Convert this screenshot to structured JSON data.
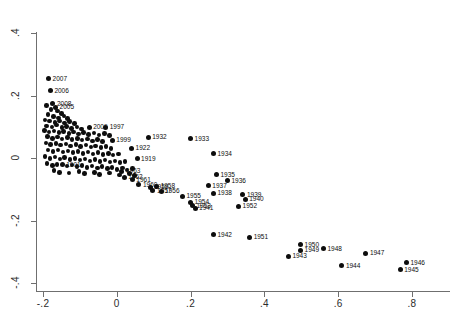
{
  "chart_data": {
    "type": "scatter",
    "title": "",
    "xlabel": "",
    "ylabel": "",
    "xlim": [
      -0.26,
      0.92
    ],
    "ylim": [
      -0.45,
      0.45
    ],
    "xticks": [
      -0.2,
      0,
      0.2,
      0.4,
      0.6,
      0.8
    ],
    "xticklabels": [
      "-.2",
      "0",
      ".2",
      ".4",
      ".6",
      ".8"
    ],
    "yticks": [
      0.4,
      0.2,
      0,
      -0.2,
      -0.4
    ],
    "yticklabels": [
      ".4",
      ".2",
      "0",
      "-.2",
      "-.4"
    ],
    "grid": false,
    "legend": false,
    "marker": "filled-circle",
    "marker_color": "#0d0d0d",
    "axis_color": "#6f6f6f",
    "points": [
      {
        "label": "2007",
        "x": -0.185,
        "y": 0.254
      },
      {
        "label": "2006",
        "x": -0.18,
        "y": 0.215
      },
      {
        "label": "2008",
        "x": -0.173,
        "y": 0.173
      },
      {
        "label": "2005",
        "x": -0.166,
        "y": 0.162
      },
      {
        "label": "",
        "x": -0.19,
        "y": 0.168
      },
      {
        "label": "",
        "x": -0.178,
        "y": 0.155
      },
      {
        "label": "",
        "x": -0.16,
        "y": 0.15
      },
      {
        "label": "",
        "x": -0.15,
        "y": 0.143
      },
      {
        "label": "",
        "x": -0.186,
        "y": 0.14
      },
      {
        "label": "",
        "x": -0.172,
        "y": 0.133
      },
      {
        "label": "",
        "x": -0.158,
        "y": 0.128
      },
      {
        "label": "",
        "x": -0.143,
        "y": 0.135
      },
      {
        "label": "",
        "x": -0.133,
        "y": 0.126
      },
      {
        "label": "",
        "x": -0.195,
        "y": 0.122
      },
      {
        "label": "",
        "x": -0.182,
        "y": 0.118
      },
      {
        "label": "",
        "x": -0.168,
        "y": 0.114
      },
      {
        "label": "",
        "x": -0.155,
        "y": 0.119
      },
      {
        "label": "",
        "x": -0.142,
        "y": 0.112
      },
      {
        "label": "",
        "x": -0.128,
        "y": 0.116
      },
      {
        "label": "",
        "x": -0.115,
        "y": 0.11
      },
      {
        "label": "",
        "x": -0.19,
        "y": 0.103
      },
      {
        "label": "",
        "x": -0.176,
        "y": 0.099
      },
      {
        "label": "",
        "x": -0.163,
        "y": 0.105
      },
      {
        "label": "",
        "x": -0.149,
        "y": 0.098
      },
      {
        "label": "",
        "x": -0.136,
        "y": 0.101
      },
      {
        "label": "",
        "x": -0.122,
        "y": 0.095
      },
      {
        "label": "",
        "x": -0.108,
        "y": 0.099
      },
      {
        "label": "",
        "x": -0.095,
        "y": 0.093
      },
      {
        "label": "2009",
        "x": -0.075,
        "y": 0.098
      },
      {
        "label": "1997",
        "x": -0.03,
        "y": 0.098
      },
      {
        "label": "",
        "x": -0.196,
        "y": 0.088
      },
      {
        "label": "",
        "x": -0.184,
        "y": 0.083
      },
      {
        "label": "",
        "x": -0.17,
        "y": 0.087
      },
      {
        "label": "",
        "x": -0.157,
        "y": 0.081
      },
      {
        "label": "",
        "x": -0.144,
        "y": 0.085
      },
      {
        "label": "",
        "x": -0.13,
        "y": 0.079
      },
      {
        "label": "",
        "x": -0.117,
        "y": 0.083
      },
      {
        "label": "",
        "x": -0.103,
        "y": 0.077
      },
      {
        "label": "",
        "x": -0.09,
        "y": 0.081
      },
      {
        "label": "",
        "x": -0.076,
        "y": 0.075
      },
      {
        "label": "",
        "x": -0.062,
        "y": 0.08
      },
      {
        "label": "",
        "x": -0.048,
        "y": 0.074
      },
      {
        "label": "",
        "x": -0.034,
        "y": 0.078
      },
      {
        "label": "",
        "x": -0.02,
        "y": 0.072
      },
      {
        "label": "",
        "x": -0.188,
        "y": 0.068
      },
      {
        "label": "",
        "x": -0.175,
        "y": 0.063
      },
      {
        "label": "",
        "x": -0.161,
        "y": 0.067
      },
      {
        "label": "",
        "x": -0.148,
        "y": 0.061
      },
      {
        "label": "",
        "x": -0.134,
        "y": 0.065
      },
      {
        "label": "",
        "x": -0.121,
        "y": 0.059
      },
      {
        "label": "",
        "x": -0.107,
        "y": 0.063
      },
      {
        "label": "",
        "x": -0.094,
        "y": 0.057
      },
      {
        "label": "",
        "x": -0.08,
        "y": 0.061
      },
      {
        "label": "",
        "x": -0.066,
        "y": 0.055
      },
      {
        "label": "",
        "x": -0.053,
        "y": 0.059
      },
      {
        "label": "",
        "x": -0.039,
        "y": 0.053
      },
      {
        "label": "1999",
        "x": -0.012,
        "y": 0.057
      },
      {
        "label": "1932",
        "x": 0.085,
        "y": 0.066
      },
      {
        "label": "1933",
        "x": 0.2,
        "y": 0.062
      },
      {
        "label": "",
        "x": -0.192,
        "y": 0.048
      },
      {
        "label": "",
        "x": -0.179,
        "y": 0.043
      },
      {
        "label": "",
        "x": -0.165,
        "y": 0.047
      },
      {
        "label": "",
        "x": -0.152,
        "y": 0.041
      },
      {
        "label": "",
        "x": -0.138,
        "y": 0.045
      },
      {
        "label": "",
        "x": -0.125,
        "y": 0.039
      },
      {
        "label": "",
        "x": -0.111,
        "y": 0.043
      },
      {
        "label": "",
        "x": -0.098,
        "y": 0.037
      },
      {
        "label": "",
        "x": -0.084,
        "y": 0.041
      },
      {
        "label": "",
        "x": -0.07,
        "y": 0.035
      },
      {
        "label": "",
        "x": -0.057,
        "y": 0.039
      },
      {
        "label": "",
        "x": -0.043,
        "y": 0.033
      },
      {
        "label": "",
        "x": -0.029,
        "y": 0.037
      },
      {
        "label": "",
        "x": -0.016,
        "y": 0.031
      },
      {
        "label": "1922",
        "x": 0.04,
        "y": 0.032
      },
      {
        "label": "1934",
        "x": 0.262,
        "y": 0.014
      },
      {
        "label": "",
        "x": -0.186,
        "y": 0.026
      },
      {
        "label": "",
        "x": -0.173,
        "y": 0.021
      },
      {
        "label": "",
        "x": -0.159,
        "y": 0.025
      },
      {
        "label": "",
        "x": -0.146,
        "y": 0.019
      },
      {
        "label": "",
        "x": -0.132,
        "y": 0.023
      },
      {
        "label": "",
        "x": -0.119,
        "y": 0.017
      },
      {
        "label": "",
        "x": -0.105,
        "y": 0.021
      },
      {
        "label": "",
        "x": -0.092,
        "y": 0.015
      },
      {
        "label": "",
        "x": -0.078,
        "y": 0.019
      },
      {
        "label": "",
        "x": -0.064,
        "y": 0.013
      },
      {
        "label": "",
        "x": -0.051,
        "y": 0.017
      },
      {
        "label": "",
        "x": -0.037,
        "y": 0.011
      },
      {
        "label": "",
        "x": -0.023,
        "y": 0.015
      },
      {
        "label": "",
        "x": -0.01,
        "y": 0.009
      },
      {
        "label": "",
        "x": 0.004,
        "y": 0.013
      },
      {
        "label": "1919",
        "x": 0.055,
        "y": -0.002
      },
      {
        "label": "",
        "x": -0.195,
        "y": 0.004
      },
      {
        "label": "",
        "x": -0.181,
        "y": -0.001
      },
      {
        "label": "",
        "x": -0.168,
        "y": 0.003
      },
      {
        "label": "",
        "x": -0.154,
        "y": -0.003
      },
      {
        "label": "",
        "x": -0.141,
        "y": 0.001
      },
      {
        "label": "",
        "x": -0.127,
        "y": -0.005
      },
      {
        "label": "",
        "x": -0.113,
        "y": -0.001
      },
      {
        "label": "",
        "x": -0.1,
        "y": -0.007
      },
      {
        "label": "",
        "x": -0.086,
        "y": -0.003
      },
      {
        "label": "",
        "x": -0.073,
        "y": -0.009
      },
      {
        "label": "",
        "x": -0.059,
        "y": -0.005
      },
      {
        "label": "",
        "x": -0.045,
        "y": -0.011
      },
      {
        "label": "",
        "x": -0.032,
        "y": -0.007
      },
      {
        "label": "",
        "x": -0.018,
        "y": -0.013
      },
      {
        "label": "",
        "x": -0.005,
        "y": -0.009
      },
      {
        "label": "",
        "x": 0.009,
        "y": -0.015
      },
      {
        "label": "",
        "x": 0.022,
        "y": -0.011
      },
      {
        "label": "1901",
        "x": -0.148,
        "y": -0.022
      },
      {
        "label": "1963",
        "x": 0.014,
        "y": -0.042
      },
      {
        "label": "",
        "x": -0.189,
        "y": -0.018
      },
      {
        "label": "",
        "x": -0.175,
        "y": -0.024
      },
      {
        "label": "",
        "x": -0.162,
        "y": -0.02
      },
      {
        "label": "",
        "x": -0.135,
        "y": -0.026
      },
      {
        "label": "",
        "x": -0.121,
        "y": -0.022
      },
      {
        "label": "",
        "x": -0.108,
        "y": -0.028
      },
      {
        "label": "",
        "x": -0.094,
        "y": -0.024
      },
      {
        "label": "",
        "x": -0.081,
        "y": -0.03
      },
      {
        "label": "",
        "x": -0.067,
        "y": -0.026
      },
      {
        "label": "",
        "x": -0.053,
        "y": -0.032
      },
      {
        "label": "",
        "x": -0.04,
        "y": -0.028
      },
      {
        "label": "",
        "x": -0.026,
        "y": -0.034
      },
      {
        "label": "",
        "x": -0.013,
        "y": -0.03
      },
      {
        "label": "",
        "x": 0.001,
        "y": -0.036
      },
      {
        "label": "",
        "x": 0.015,
        "y": -0.032
      },
      {
        "label": "",
        "x": 0.028,
        "y": -0.038
      },
      {
        "label": "",
        "x": 0.042,
        "y": -0.034
      },
      {
        "label": "",
        "x": -0.17,
        "y": -0.04
      },
      {
        "label": "",
        "x": -0.156,
        "y": -0.046
      },
      {
        "label": "",
        "x": -0.129,
        "y": -0.048
      },
      {
        "label": "",
        "x": -0.102,
        "y": -0.044
      },
      {
        "label": "",
        "x": -0.088,
        "y": -0.05
      },
      {
        "label": "",
        "x": -0.061,
        "y": -0.046
      },
      {
        "label": "",
        "x": -0.047,
        "y": -0.052
      },
      {
        "label": "",
        "x": -0.02,
        "y": -0.048
      },
      {
        "label": "",
        "x": 0.007,
        "y": -0.054
      },
      {
        "label": "",
        "x": 0.034,
        "y": -0.05
      },
      {
        "label": "",
        "x": 0.048,
        "y": -0.056
      },
      {
        "label": "1962",
        "x": 0.02,
        "y": -0.062
      },
      {
        "label": "1961",
        "x": 0.042,
        "y": -0.07
      },
      {
        "label": "1935",
        "x": 0.27,
        "y": -0.053
      },
      {
        "label": "1936",
        "x": 0.3,
        "y": -0.072
      },
      {
        "label": "1960",
        "x": 0.06,
        "y": -0.085
      },
      {
        "label": "1959",
        "x": 0.09,
        "y": -0.093
      },
      {
        "label": "1958",
        "x": 0.108,
        "y": -0.09
      },
      {
        "label": "1937",
        "x": 0.248,
        "y": -0.088
      },
      {
        "label": "1957",
        "x": 0.098,
        "y": -0.104
      },
      {
        "label": "1956",
        "x": 0.12,
        "y": -0.106
      },
      {
        "label": "1938",
        "x": 0.262,
        "y": -0.112
      },
      {
        "label": "1955",
        "x": 0.178,
        "y": -0.122
      },
      {
        "label": "1939",
        "x": 0.342,
        "y": -0.118
      },
      {
        "label": "1940",
        "x": 0.348,
        "y": -0.132
      },
      {
        "label": "1954",
        "x": 0.2,
        "y": -0.142
      },
      {
        "label": "1953",
        "x": 0.205,
        "y": -0.152
      },
      {
        "label": "1941",
        "x": 0.212,
        "y": -0.16
      },
      {
        "label": "1952",
        "x": 0.33,
        "y": -0.155
      },
      {
        "label": "1942",
        "x": 0.262,
        "y": -0.245
      },
      {
        "label": "1951",
        "x": 0.36,
        "y": -0.253
      },
      {
        "label": "1950",
        "x": 0.498,
        "y": -0.278
      },
      {
        "label": "1949",
        "x": 0.498,
        "y": -0.295
      },
      {
        "label": "1948",
        "x": 0.56,
        "y": -0.29
      },
      {
        "label": "1943",
        "x": 0.465,
        "y": -0.315
      },
      {
        "label": "1947",
        "x": 0.675,
        "y": -0.305
      },
      {
        "label": "1944",
        "x": 0.61,
        "y": -0.345
      },
      {
        "label": "1946",
        "x": 0.785,
        "y": -0.335
      },
      {
        "label": "1945",
        "x": 0.768,
        "y": -0.358
      }
    ]
  }
}
